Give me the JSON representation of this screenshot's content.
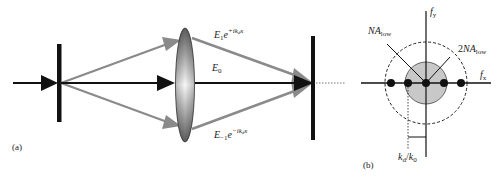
{
  "panel_a": {
    "label": "(a)",
    "field_labels": {
      "plus1": {
        "base": "E",
        "sub": "1",
        "exp_base": "e",
        "exp": "+ik",
        "exp_sub": "d",
        "exp_tail": "x"
      },
      "zero": {
        "base": "E",
        "sub": "0"
      },
      "minus1": {
        "base": "E",
        "sub": "−1",
        "exp_base": "e",
        "exp": "−ik",
        "exp_sub": "d",
        "exp_tail": "x"
      }
    },
    "components": [
      "grating",
      "lens",
      "detector"
    ]
  },
  "panel_b": {
    "label": "(b)",
    "axis_x": {
      "base": "f",
      "sub": "x"
    },
    "axis_y": {
      "base": "f",
      "sub": "y"
    },
    "na_low": {
      "base": "NA",
      "sub": "low"
    },
    "two_na_low": {
      "prefix": "2",
      "base": "NA",
      "sub": "low"
    },
    "spacing": {
      "num": "k",
      "num_sub": "d",
      "slash": "/",
      "den": "k",
      "den_sub": "0"
    }
  },
  "colors": {
    "black": "#111111",
    "gray_arrow": "#8a8a8a",
    "pupil_fill": "#c8c8c8",
    "lens_dark": "#6e6e6e",
    "lens_light": "#f5f5f5"
  }
}
